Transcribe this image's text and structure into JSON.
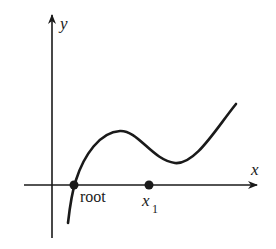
{
  "diagram": {
    "axes": {
      "x_label": "x",
      "y_label": "y"
    },
    "points": {
      "root_label": "root",
      "x1_label": "x",
      "x1_subscript": "1"
    },
    "colors": {
      "ink": "#1a1a1a",
      "background": "#ffffff"
    }
  }
}
